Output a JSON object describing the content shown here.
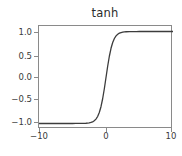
{
  "chart_data": {
    "type": "line",
    "title": "tanh",
    "xlabel": "",
    "ylabel": "",
    "xlim": [
      -10,
      10
    ],
    "ylim": [
      -1.12,
      1.12
    ],
    "grid": false,
    "legend": null,
    "line_color": "#3c3c3c",
    "axes_color": "#8a8a8a",
    "background_color": "#ffffff",
    "xticks": [
      -10,
      0,
      10
    ],
    "xtick_labels": [
      "−10",
      "0",
      "10"
    ],
    "yticks": [
      1.0,
      0.5,
      0.0,
      -0.5,
      -1.0
    ],
    "ytick_labels": [
      "1.0",
      "0.5",
      "0.0",
      "−0.5",
      "−1.0"
    ],
    "series": [
      {
        "name": "tanh(x)",
        "x": [
          -10,
          -9.5,
          -9,
          -8.5,
          -8,
          -7.5,
          -7,
          -6.5,
          -6,
          -5.5,
          -5,
          -4.5,
          -4,
          -3.5,
          -3,
          -2.75,
          -2.5,
          -2.25,
          -2,
          -1.75,
          -1.5,
          -1.25,
          -1,
          -0.75,
          -0.5,
          -0.25,
          0,
          0.25,
          0.5,
          0.75,
          1,
          1.25,
          1.5,
          1.75,
          2,
          2.25,
          2.5,
          2.75,
          3,
          3.5,
          4,
          4.5,
          5,
          5.5,
          6,
          6.5,
          7,
          7.5,
          8,
          8.5,
          9,
          9.5,
          10
        ],
        "y": [
          -1.0,
          -1.0,
          -1.0,
          -1.0,
          -1.0,
          -1.0,
          -1.0,
          -1.0,
          -0.99999,
          -0.99997,
          -0.9999,
          -0.99975,
          -0.99933,
          -0.99818,
          -0.99505,
          -0.99186,
          -0.98661,
          -0.97803,
          -0.96403,
          -0.94138,
          -0.90515,
          -0.84828,
          -0.76159,
          -0.63515,
          -0.46212,
          -0.24492,
          0.0,
          0.24492,
          0.46212,
          0.63515,
          0.76159,
          0.84828,
          0.90515,
          0.94138,
          0.96403,
          0.97803,
          0.98661,
          0.99186,
          0.99505,
          0.99818,
          0.99933,
          0.99975,
          0.9999,
          0.99997,
          0.99999,
          1.0,
          1.0,
          1.0,
          1.0,
          1.0,
          1.0,
          1.0,
          1.0
        ]
      }
    ]
  }
}
